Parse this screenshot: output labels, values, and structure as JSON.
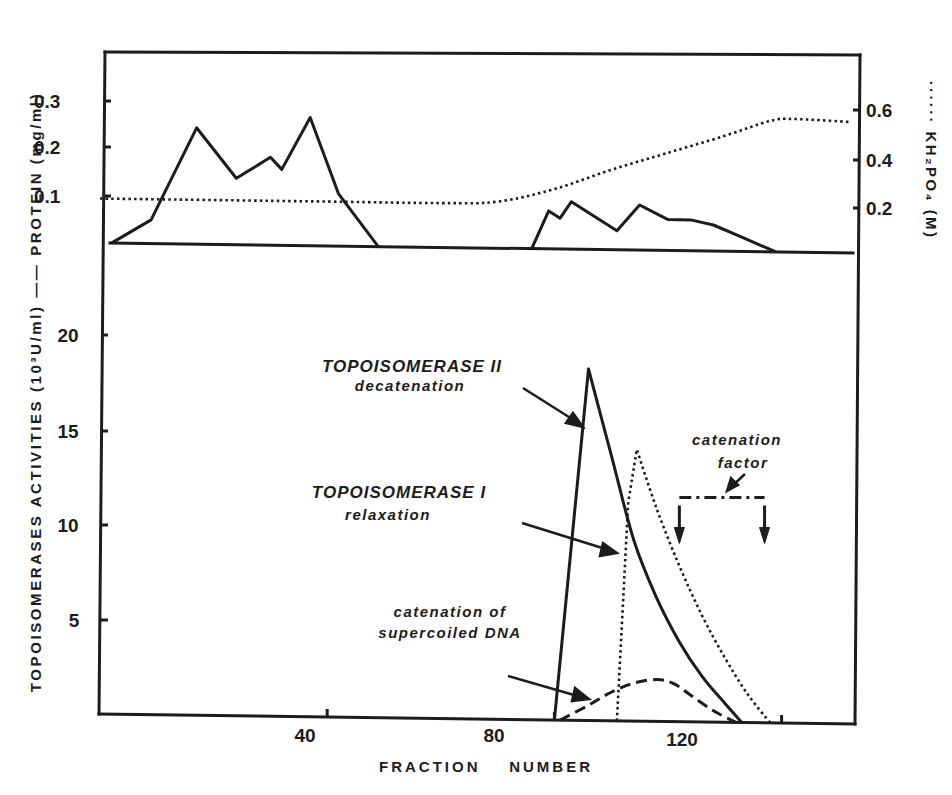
{
  "chart_data": [
    {
      "panel": "top",
      "type": "line",
      "xlabel": "FRACTION NUMBER",
      "ylabel_left": "PROTEIN (mg/ml)",
      "ylabel_right": "KH2PO4 (M)",
      "left_ticks": [
        "0.1",
        "0.2",
        "0.3"
      ],
      "right_ticks": [
        "0.2",
        "0.4",
        "0.6"
      ],
      "ylim_left": [
        0,
        0.35
      ],
      "ylim_right": [
        0,
        0.75
      ],
      "grid": false,
      "series": [
        {
          "name": "PROTEIN (mg/ml)",
          "style": "solid",
          "axis": "left",
          "x": [
            2,
            9,
            17,
            24,
            30,
            32,
            37,
            42,
            49
          ],
          "y": [
            0.0,
            0.05,
            0.245,
            0.14,
            0.185,
            0.16,
            0.27,
            0.11,
            0.0
          ]
        },
        {
          "name": "PROTEIN (mg/ml) second peak",
          "style": "solid",
          "axis": "left",
          "x": [
            76,
            79,
            81,
            83,
            91,
            95,
            100,
            104,
            108,
            113,
            119
          ],
          "y": [
            0.0,
            0.08,
            0.065,
            0.1,
            0.04,
            0.095,
            0.065,
            0.065,
            0.055,
            0.03,
            0.0
          ]
        },
        {
          "name": "KH2PO4 (M)",
          "style": "dotted",
          "axis": "right",
          "x": [
            0,
            40,
            60,
            70,
            80,
            90,
            100,
            110,
            118,
            122,
            132
          ],
          "y": [
            0.2,
            0.2,
            0.2,
            0.21,
            0.27,
            0.36,
            0.44,
            0.52,
            0.59,
            0.6,
            0.59
          ]
        }
      ]
    },
    {
      "panel": "bottom",
      "type": "line",
      "xlabel": "FRACTION NUMBER",
      "ylabel": "TOPOISOMERASES ACTIVITIES (10³U/ml)",
      "x_ticks": [
        "40",
        "80",
        "120"
      ],
      "y_ticks": [
        "5",
        "10",
        "15",
        "20"
      ],
      "xlim": [
        0,
        132
      ],
      "ylim": [
        0,
        22
      ],
      "grid": false,
      "series": [
        {
          "name": "TOPOISOMERASE II decatenation",
          "style": "solid",
          "x": [
            80,
            86,
            90,
            94,
            98,
            102,
            106,
            110,
            113
          ],
          "y": [
            0,
            18.5,
            14,
            9.5,
            6.5,
            4.2,
            2.4,
            1.0,
            0
          ]
        },
        {
          "name": "TOPOISOMERASE I relaxation",
          "style": "dotted",
          "x": [
            91,
            93,
            94.5,
            98,
            102,
            106,
            110,
            114,
            118
          ],
          "y": [
            0,
            11.5,
            14.3,
            11.2,
            8.2,
            5.6,
            3.4,
            1.5,
            0
          ]
        },
        {
          "name": "catenation of supercoiled DNA",
          "style": "dashed",
          "x": [
            81,
            86,
            90,
            94,
            98,
            101,
            104,
            108,
            112
          ],
          "y": [
            0,
            0.8,
            1.5,
            2.0,
            2.2,
            2.0,
            1.4,
            0.6,
            0
          ]
        },
        {
          "name": "catenation factor",
          "style": "dash-dot bracket",
          "x": [
            102,
            117
          ],
          "y": [
            11.8,
            11.8
          ],
          "arrows_down_at": [
            102,
            117
          ]
        }
      ]
    }
  ],
  "labels": {
    "left_axis_title": "TOPOISOMERASES ACTIVITIES (10³U/ml) —— PROTEIN (mg/ml)",
    "right_axis_title": "······ KH₂PO₄ (M)",
    "x_axis_title": "FRACTION    NUMBER",
    "top_left_ticks": [
      "0.3",
      "0.2",
      "0.1"
    ],
    "top_right_ticks": [
      "0.6",
      "0.4",
      "0.2"
    ],
    "bottom_y_ticks": [
      "20",
      "15",
      "10",
      "5"
    ],
    "x_ticks": [
      "40",
      "80",
      "120"
    ],
    "annotations": {
      "topo2_title": "TOPOISOMERASE II",
      "topo2_sub": "decatenation",
      "topo1_title": "TOPOISOMERASE I",
      "topo1_sub": "relaxation",
      "cat_line1": "catenation of",
      "cat_line2": "supercoiled DNA",
      "factor_line1": "catenation",
      "factor_line2": "factor"
    }
  },
  "colors": {
    "ink": "#1c1c1c",
    "background": "#ffffff"
  }
}
